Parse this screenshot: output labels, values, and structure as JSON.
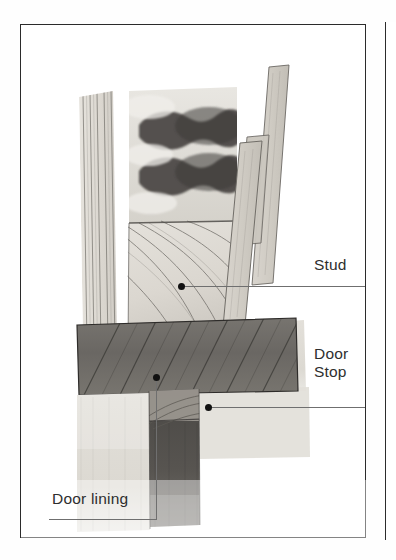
{
  "figure": {
    "kind": "technical-illustration",
    "medium": "pencil-and-wash scanned book plate",
    "frame_color": "#2b2b2b",
    "background_color": "#ffffff",
    "leader_line_color": "#6f6f6f",
    "label_text_color": "#2e2e2e"
  },
  "labels": {
    "stud": "Stud",
    "door_stop": "Door\nStop",
    "door_lining": "Door lining"
  },
  "callouts": [
    {
      "id": "stud",
      "label": "Stud",
      "dot": {
        "x": 180,
        "y": 285
      },
      "leader_end": {
        "x": 364,
        "y": 285
      },
      "text_position": {
        "x": 314,
        "y": 256
      }
    },
    {
      "id": "door-stop",
      "label": "Door Stop",
      "dot": {
        "x": 207,
        "y": 406
      },
      "leader_end": {
        "x": 364,
        "y": 406
      },
      "text_position": {
        "x": 314,
        "y": 345
      }
    },
    {
      "id": "door-lining",
      "label": "Door lining",
      "dot": {
        "x": 155,
        "y": 376
      },
      "leader_corner": {
        "x": 155,
        "y": 518
      },
      "leader_end": {
        "x": 48,
        "y": 518
      },
      "text_position": {
        "x": 52,
        "y": 490
      }
    }
  ],
  "components": [
    {
      "id": "plasterboard-layers",
      "note": "vertical lined board layers, left edge"
    },
    {
      "id": "insulation-end-grain",
      "note": "dark bone-shaped end-grain marks, top"
    },
    {
      "id": "stud",
      "note": "light timber post with curved grain, centre"
    },
    {
      "id": "door-stop",
      "note": "dark diagonally-hatched horizontal rail"
    },
    {
      "id": "door-lining-jamb",
      "note": "pale vertical board, lower left"
    },
    {
      "id": "door-leaf",
      "note": "dark vertical block, lower centre"
    },
    {
      "id": "architrave-strips",
      "note": "two angled pale strips, right side"
    }
  ],
  "palette": {
    "paper": "#ffffff",
    "light_wood": "#dedbd4",
    "mid_wood": "#b9b5ad",
    "dark_wood": "#6d6a66",
    "darkest": "#3f3d3b",
    "outline": "#55514d"
  }
}
